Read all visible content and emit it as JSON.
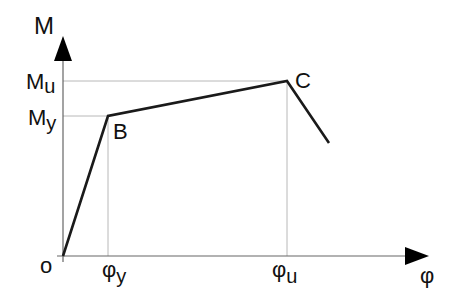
{
  "diagram": {
    "axes": {
      "y_label": "M",
      "x_label": "φ",
      "origin_label": "o"
    },
    "y_ticks": [
      {
        "label": "M",
        "sub": "u"
      },
      {
        "label": "M",
        "sub": "y"
      }
    ],
    "x_ticks": [
      {
        "label": "φ",
        "sub": "y"
      },
      {
        "label": "φ",
        "sub": "u"
      }
    ],
    "points": [
      {
        "name": "B",
        "label": "B"
      },
      {
        "name": "C",
        "label": "C"
      }
    ],
    "colors": {
      "curve": "#1a1a1a",
      "guide": "#b0b0b0",
      "axis": "#555555"
    }
  }
}
